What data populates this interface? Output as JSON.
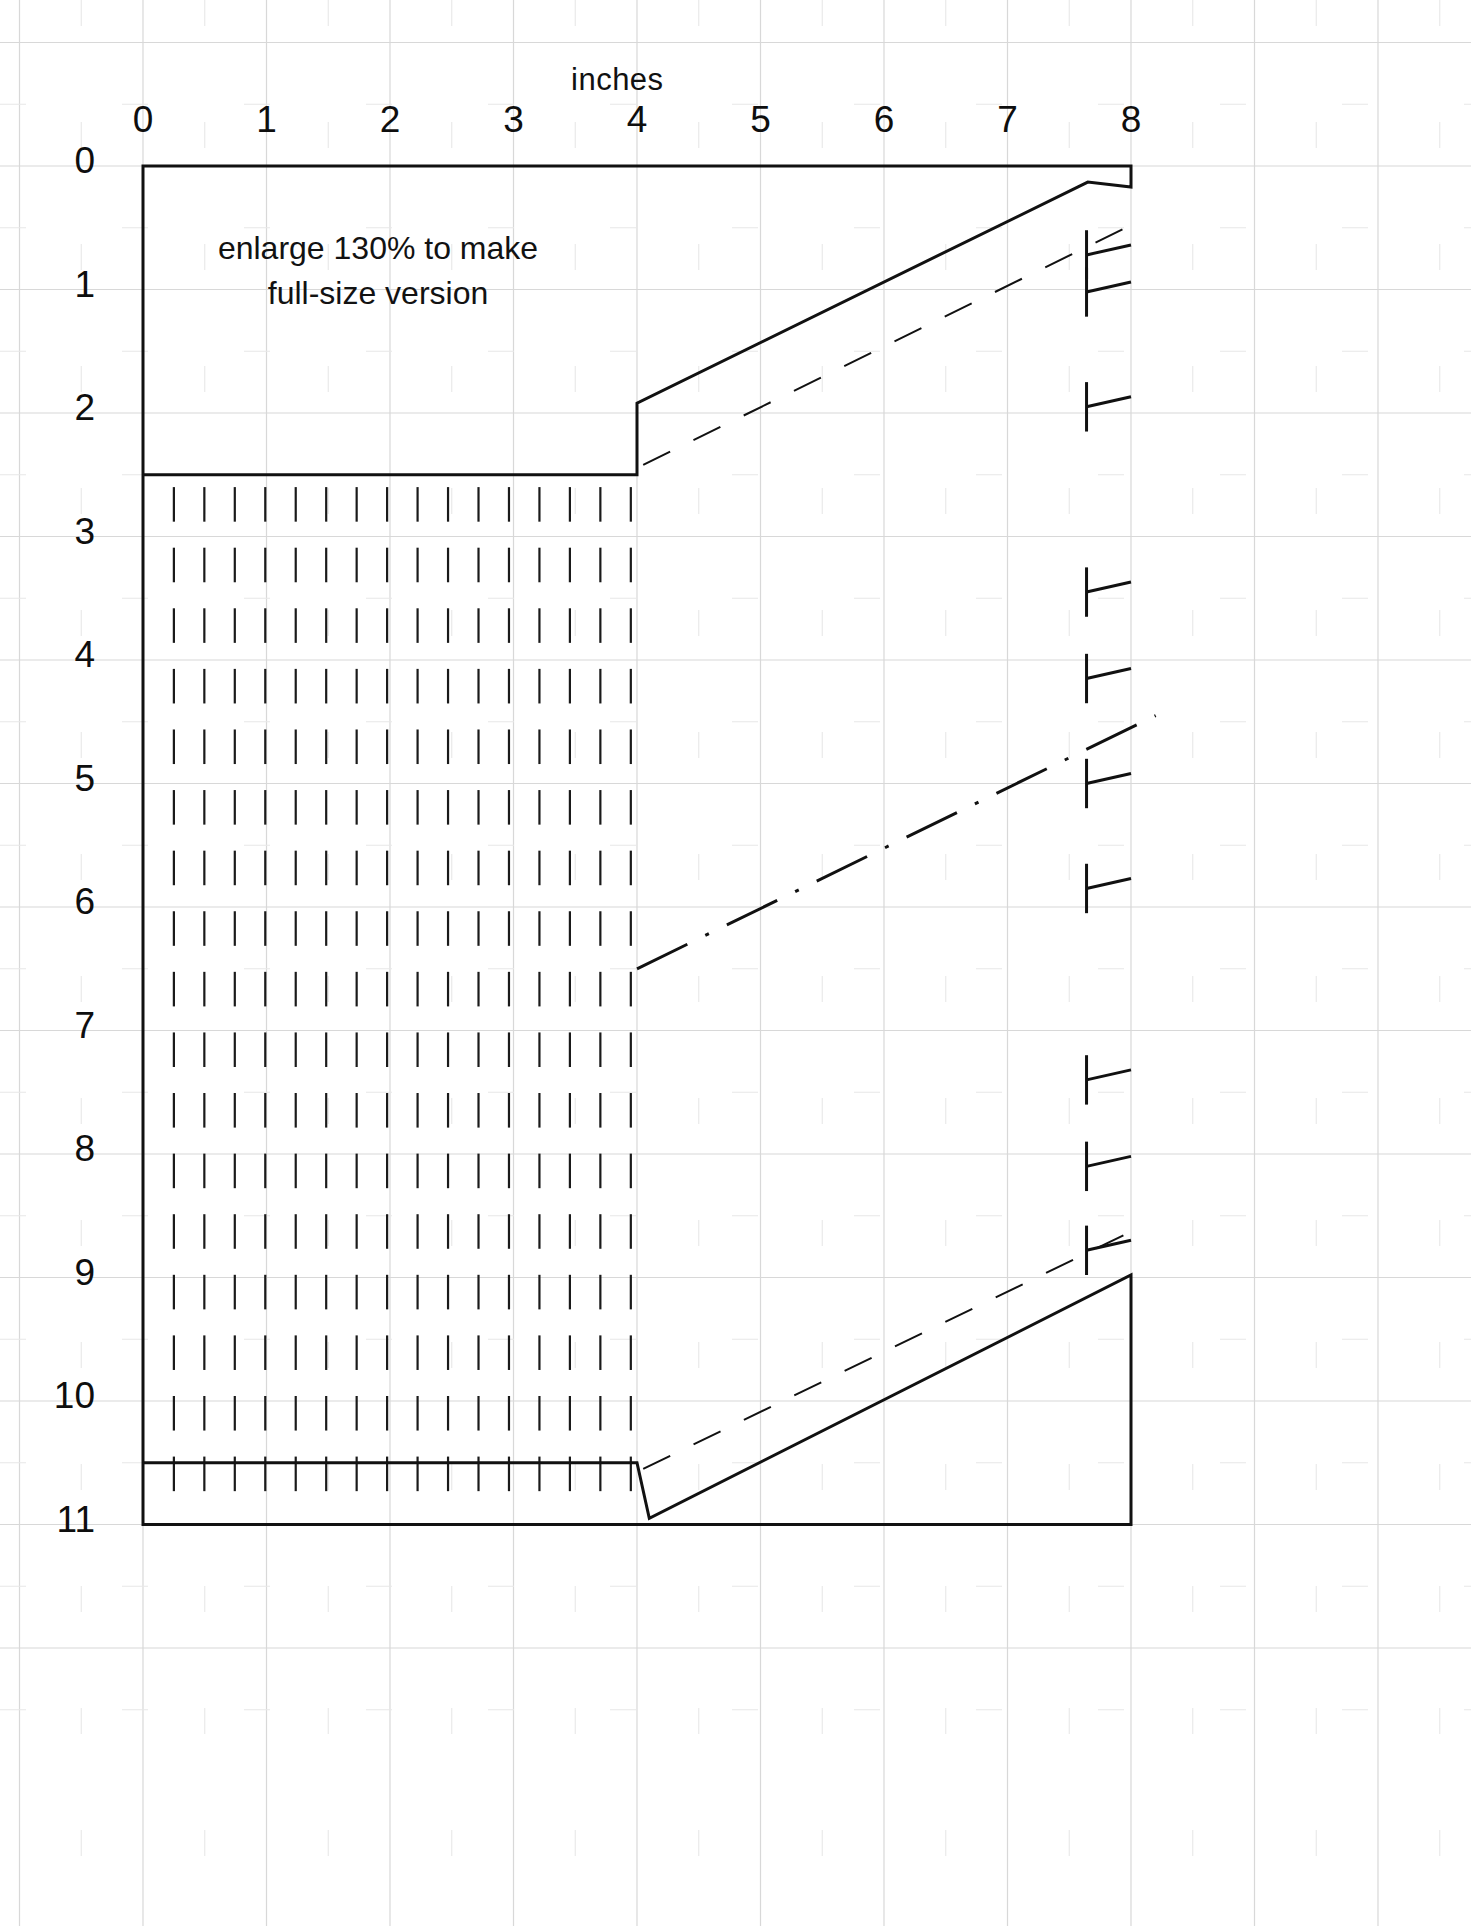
{
  "sheet": {
    "width": 1471,
    "height": 1926,
    "background": "#ffffff",
    "ink_color": "#111111",
    "grid_color": "#d8d8d8",
    "grid_minor_color": "#e8e8e8"
  },
  "rulers": {
    "horizontal": {
      "title": "inches",
      "labels": [
        "0",
        "1",
        "2",
        "3",
        "4",
        "5",
        "6",
        "7",
        "8"
      ],
      "unit": "inch",
      "origin_px": 143,
      "spacing_px": 123.5,
      "label_y_px": 99,
      "title_y_px": 62
    },
    "vertical": {
      "labels": [
        "0",
        "1",
        "2",
        "3",
        "4",
        "5",
        "6",
        "7",
        "8",
        "9",
        "10",
        "11"
      ],
      "unit": "inch",
      "origin_px": 166,
      "spacing_px": 123.5,
      "label_x_px": 95
    }
  },
  "annotation": {
    "line1": "enlarge 130% to make",
    "line2": "full-size version",
    "x_px": 378,
    "y_px": 226
  },
  "chart_data": {
    "type": "line",
    "xlabel": "inches",
    "ylabel": "inches",
    "xlim": [
      0,
      8.4
    ],
    "ylim": [
      0,
      11.0
    ],
    "grid": true,
    "legend": "none",
    "series": [
      {
        "name": "cut-line-outline",
        "style": "solid",
        "linewidth": 3,
        "points": [
          [
            0.0,
            0.0
          ],
          [
            8.0,
            0.0
          ],
          [
            8.0,
            0.17
          ],
          [
            7.65,
            0.13
          ],
          [
            4.0,
            1.92
          ],
          [
            4.0,
            2.5
          ],
          [
            0.0,
            2.5
          ],
          [
            0.0,
            10.5
          ],
          [
            4.0,
            10.5
          ],
          [
            4.1,
            10.95
          ],
          [
            8.0,
            8.98
          ],
          [
            8.0,
            11.0
          ],
          [
            0.0,
            11.0
          ]
        ]
      },
      {
        "name": "upper-stitch-guide",
        "style": "dashed",
        "linewidth": 2,
        "points": [
          [
            4.05,
            2.42
          ],
          [
            8.1,
            0.43
          ]
        ]
      },
      {
        "name": "fold-line",
        "style": "dash-dot",
        "linewidth": 3,
        "points": [
          [
            4.0,
            6.5
          ],
          [
            8.2,
            4.45
          ]
        ]
      },
      {
        "name": "lower-stitch-guide",
        "style": "dashed",
        "linewidth": 2,
        "points": [
          [
            4.05,
            10.55
          ],
          [
            8.1,
            8.58
          ]
        ]
      }
    ],
    "gather_marks": {
      "name": "gather-tick-grid",
      "description": "Vertical gather / pleat tick marks filling the rectangular panel",
      "x_start_inch": 0.25,
      "x_end_inch": 3.95,
      "x_count": 16,
      "y_start_inch": 2.6,
      "y_end_inch": 10.45,
      "y_count": 17,
      "tick_length_inch": 0.28
    },
    "notch_marks": {
      "name": "seam-notch",
      "description": "T-shaped notch marks along the right edge",
      "y_inch": [
        0.72,
        1.02,
        1.95,
        3.45,
        4.15,
        5.0,
        5.85,
        7.4,
        8.1,
        8.78
      ],
      "x_right_inch": 8.0,
      "arm_length_inch": 0.36,
      "bar_height_inch": 0.2
    }
  },
  "icons": {
    "ruler": "ruler-icon"
  }
}
